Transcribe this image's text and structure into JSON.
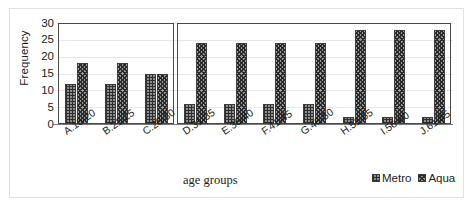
{
  "chart_data": {
    "type": "bar",
    "title": "",
    "xlabel": "age groups",
    "ylabel": "Frequency",
    "ylim": [
      0,
      30
    ],
    "yticks": [
      0,
      5,
      10,
      15,
      20,
      25,
      30
    ],
    "grid": true,
    "legend_position": "bottom-right",
    "categories": [
      "A.16-20",
      "B.21-25",
      "C.26-30",
      "D.31-35",
      "E.36-40",
      "F.41-45",
      "G.46-50",
      "H.51-55",
      "I.56-60",
      "J.61-65"
    ],
    "series": [
      {
        "name": "Metro",
        "pattern": "grid",
        "values": [
          12,
          12,
          15,
          6,
          6,
          6,
          6,
          2,
          2,
          2
        ]
      },
      {
        "name": "Aqua",
        "pattern": "checker",
        "values": [
          18,
          18,
          15,
          24,
          24,
          24,
          24,
          28,
          28,
          28
        ]
      }
    ],
    "panels": [
      {
        "name": "panel-left",
        "categories": [
          "A.16-20",
          "B.21-25",
          "C.26-30"
        ]
      },
      {
        "name": "panel-right",
        "categories": [
          "D.31-35",
          "E.36-40",
          "F.41-45",
          "G.46-50",
          "H.51-55",
          "I.56-60",
          "J.61-65"
        ]
      }
    ]
  }
}
